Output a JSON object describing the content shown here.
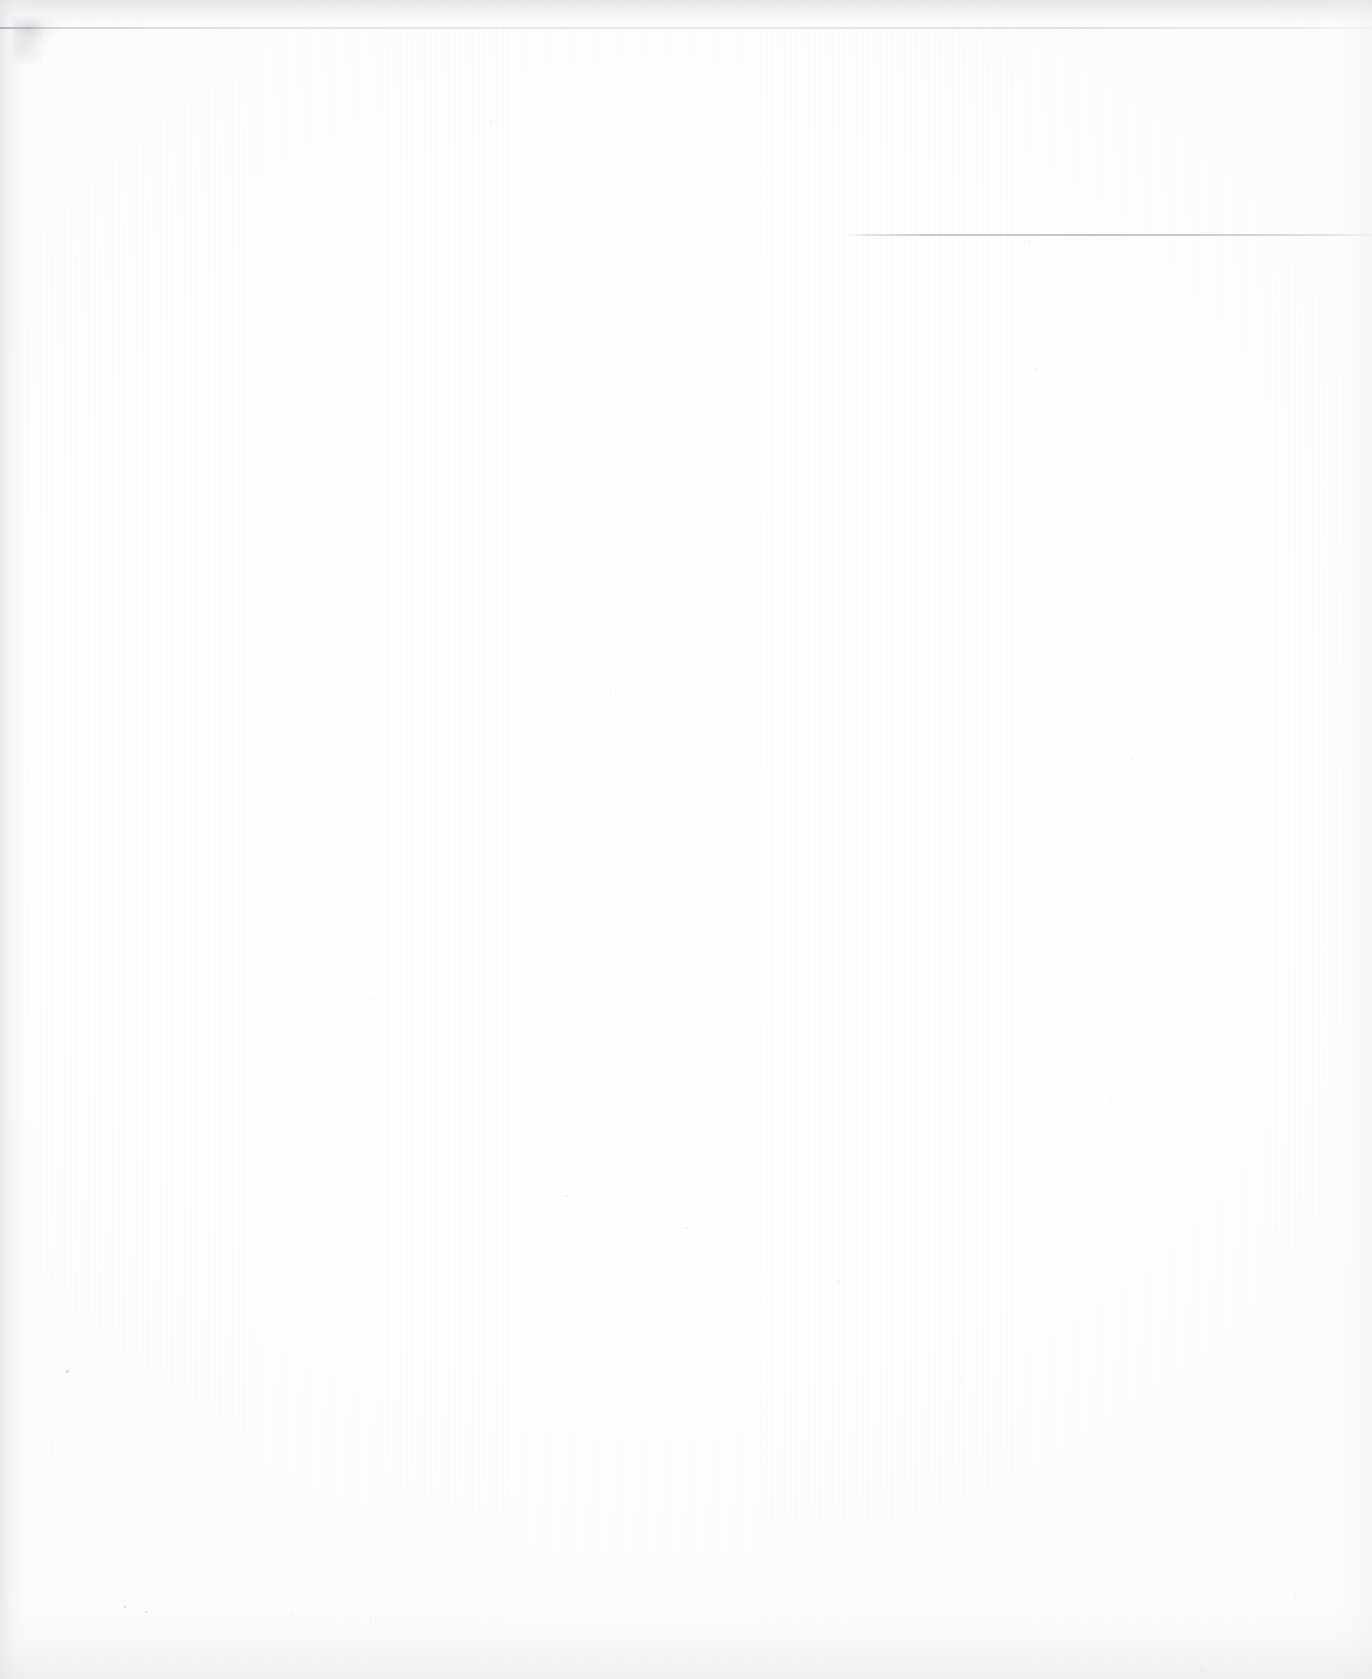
{
  "document": {
    "type": "scanned-page",
    "state": "blank",
    "visible_text": "",
    "page_background_color": "#fefefe",
    "canvas_width": 1372,
    "canvas_height": 1679
  },
  "marks": {
    "top_scan_edge": {
      "name": "top-scan-edge-line",
      "color": "#c9c9d1",
      "y": 27,
      "x_start": 0,
      "x_end": 1372
    },
    "corner_smudge": {
      "name": "scanner-smudge",
      "color": "#8c8c96",
      "x": 12,
      "y": 16,
      "width": 58,
      "height": 48
    },
    "horizontal_rule": {
      "name": "faint-horizontal-rule",
      "color": "#b6b6c0",
      "y": 234,
      "x_start": 845,
      "x_end": 1372
    }
  },
  "edge_shadows": {
    "top_color": "#dfdfe3",
    "left_color": "#e2e2e6",
    "right_color": "#ececef",
    "bottom_color": "#e7e7eb"
  },
  "specks": [
    {
      "x": 490,
      "y": 120,
      "size": 2,
      "faint": true
    },
    {
      "x": 1028,
      "y": 240,
      "size": 2,
      "faint": true
    },
    {
      "x": 1035,
      "y": 368,
      "size": 2,
      "faint": true
    },
    {
      "x": 610,
      "y": 690,
      "size": 2,
      "faint": true
    },
    {
      "x": 205,
      "y": 845,
      "size": 2,
      "faint": true
    },
    {
      "x": 1131,
      "y": 757,
      "size": 2,
      "faint": true
    },
    {
      "x": 372,
      "y": 998,
      "size": 2,
      "faint": true
    },
    {
      "x": 566,
      "y": 1195,
      "size": 2,
      "faint": true
    },
    {
      "x": 1109,
      "y": 1100,
      "size": 2,
      "faint": true
    },
    {
      "x": 686,
      "y": 1227,
      "size": 2,
      "faint": true
    },
    {
      "x": 66,
      "y": 1370,
      "size": 3,
      "faint": false
    },
    {
      "x": 52,
      "y": 1447,
      "size": 2,
      "faint": true
    },
    {
      "x": 124,
      "y": 1606,
      "size": 2,
      "faint": false
    },
    {
      "x": 145,
      "y": 1611,
      "size": 2,
      "faint": false
    },
    {
      "x": 292,
      "y": 1614,
      "size": 2,
      "faint": true
    },
    {
      "x": 370,
      "y": 1620,
      "size": 2,
      "faint": true
    },
    {
      "x": 1200,
      "y": 1668,
      "size": 2,
      "faint": true
    },
    {
      "x": 838,
      "y": 1280,
      "size": 2,
      "faint": true
    },
    {
      "x": 960,
      "y": 1378,
      "size": 2,
      "faint": true
    },
    {
      "x": 1294,
      "y": 1596,
      "size": 2,
      "faint": true
    }
  ]
}
